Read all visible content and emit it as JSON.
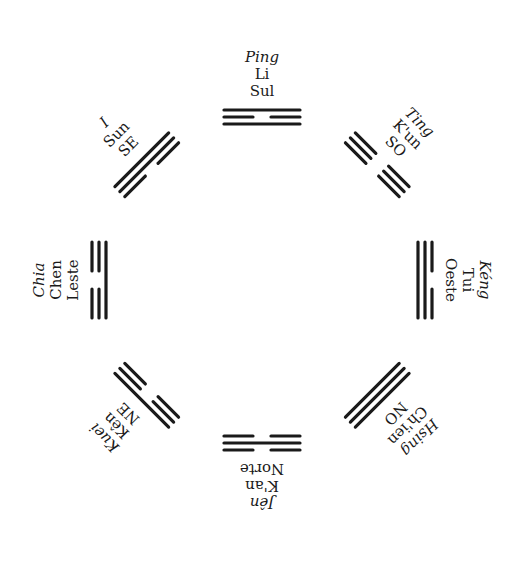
{
  "diagram": {
    "type": "bagua-trigram-arrangement",
    "center": [
      260,
      280
    ],
    "line_color": "#1a1a1a",
    "background": "#ffffff",
    "trigrams": [
      {
        "id": "sul",
        "angle": 0,
        "name": "Ping",
        "trigram": "Li",
        "direction": "Sul",
        "lines_outer_to_inner": [
          "solid",
          "broken",
          "solid"
        ]
      },
      {
        "id": "so",
        "angle": 45,
        "name": "Ting",
        "trigram": "K'un",
        "direction": "SO",
        "lines_outer_to_inner": [
          "broken",
          "broken",
          "broken"
        ]
      },
      {
        "id": "oeste",
        "angle": 90,
        "name": "Kéng",
        "trigram": "Tui",
        "direction": "Oeste",
        "lines_outer_to_inner": [
          "broken",
          "solid",
          "solid"
        ]
      },
      {
        "id": "no",
        "angle": 135,
        "name": "Hsing",
        "trigram": "Ch'ien",
        "direction": "NO",
        "lines_outer_to_inner": [
          "solid",
          "solid",
          "solid"
        ]
      },
      {
        "id": "norte",
        "angle": 180,
        "name": "Jên",
        "trigram": "K'an",
        "direction": "Norte",
        "lines_outer_to_inner": [
          "broken",
          "solid",
          "broken"
        ]
      },
      {
        "id": "ne",
        "angle": -135,
        "name": "Kuei",
        "trigram": "Kên",
        "direction": "NE",
        "lines_outer_to_inner": [
          "solid",
          "broken",
          "broken"
        ]
      },
      {
        "id": "leste",
        "angle": -90,
        "name": "Chia",
        "trigram": "Chen",
        "direction": "Leste",
        "lines_outer_to_inner": [
          "broken",
          "broken",
          "solid"
        ]
      },
      {
        "id": "se",
        "angle": -45,
        "name": "I",
        "trigram": "Sun",
        "direction": "SE",
        "lines_outer_to_inner": [
          "solid",
          "solid",
          "broken"
        ]
      }
    ]
  }
}
